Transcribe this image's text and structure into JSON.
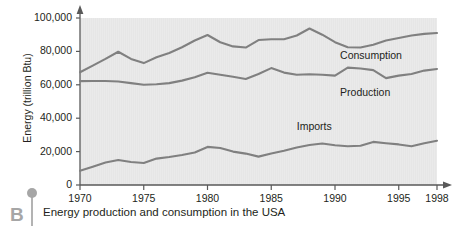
{
  "figure": {
    "panel_letter": "B",
    "caption": "Energy production and consumption in the USA",
    "top_cut_text": ""
  },
  "chart_data": {
    "type": "line",
    "title": "",
    "xlabel": "",
    "ylabel": "Energy (trillion Btu)",
    "xlim": [
      1970,
      1998
    ],
    "ylim": [
      0,
      100000
    ],
    "xticks": [
      1970,
      1975,
      1980,
      1985,
      1990,
      1995,
      1998
    ],
    "xtick_labels": [
      "1970",
      "1975",
      "1980",
      "1985",
      "1990",
      "1995",
      "1998"
    ],
    "yticks": [
      0,
      20000,
      40000,
      60000,
      80000,
      100000
    ],
    "ytick_labels": [
      "0",
      "20,000",
      "40,000",
      "60,000",
      "80,000",
      "100,000"
    ],
    "grid": false,
    "legend_position": "inline-right",
    "plot_bg": "#e6e6e6",
    "line_color": "#808080",
    "axis_color": "#595959",
    "x": [
      1970,
      1971,
      1972,
      1973,
      1974,
      1975,
      1976,
      1977,
      1978,
      1979,
      1980,
      1981,
      1982,
      1983,
      1984,
      1985,
      1986,
      1987,
      1988,
      1989,
      1990,
      1991,
      1992,
      1993,
      1994,
      1995,
      1996,
      1997,
      1998
    ],
    "series": [
      {
        "name": "Consumption",
        "values": [
          67500,
          71500,
          75500,
          79800,
          75500,
          73000,
          76500,
          79000,
          82500,
          86500,
          89800,
          85500,
          83000,
          82300,
          86800,
          87300,
          87300,
          89500,
          93700,
          90000,
          85500,
          82500,
          82300,
          84000,
          86500,
          88000,
          89500,
          90500,
          91000
        ]
      },
      {
        "name": "Production",
        "values": [
          62200,
          62300,
          62300,
          62000,
          61000,
          60000,
          60300,
          61000,
          62500,
          64500,
          67200,
          66000,
          64800,
          63500,
          66500,
          70000,
          67300,
          66000,
          66300,
          66000,
          65500,
          70300,
          69800,
          68800,
          64000,
          65500,
          66500,
          68500,
          69500
        ]
      },
      {
        "name": "Imports",
        "values": [
          8500,
          11000,
          13500,
          15000,
          13800,
          13200,
          15800,
          16800,
          18000,
          19500,
          22800,
          22200,
          20000,
          18800,
          17000,
          18800,
          20500,
          22500,
          24000,
          24800,
          23800,
          23200,
          23500,
          25800,
          25000,
          24300,
          23200,
          25000,
          26500
        ]
      }
    ]
  }
}
